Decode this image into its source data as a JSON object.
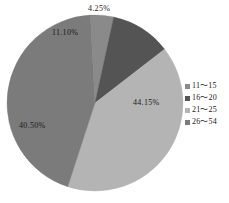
{
  "chart_data": {
    "type": "pie",
    "title": "",
    "subtitle": "",
    "xlabel": "",
    "ylabel": "",
    "grid": false,
    "legend_position": "right",
    "categories": [
      "11〜15",
      "16〜20",
      "21〜25",
      "26〜54"
    ],
    "values": [
      4.25,
      11.1,
      40.5,
      44.15
    ],
    "value_labels": [
      "4.25%",
      "11.10%",
      "40.50%",
      "44.15%"
    ],
    "colors": [
      "#8a8a8a",
      "#545454",
      "#b4b4b4",
      "#7b7b7b"
    ],
    "slices": [
      {
        "label": "4.25%",
        "category": "11〜15",
        "value": 4.25,
        "color": "#8a8a8a"
      },
      {
        "label": "11.10%",
        "category": "16〜20",
        "value": 11.1,
        "color": "#545454"
      },
      {
        "label": "40.50%",
        "category": "21〜25",
        "value": 40.5,
        "color": "#b4b4b4"
      },
      {
        "label": "44.15%",
        "category": "26〜54",
        "value": 44.15,
        "color": "#7b7b7b"
      }
    ],
    "start_angle_deg": -3,
    "total": 100.0
  },
  "legend": {
    "items": [
      {
        "label": "11〜15",
        "color": "#8a8a8a"
      },
      {
        "label": "16〜20",
        "color": "#545454"
      },
      {
        "label": "21〜25",
        "color": "#b4b4b4"
      },
      {
        "label": "26〜54",
        "color": "#7b7b7b"
      }
    ]
  },
  "labels": {
    "slice_0": "4.25%",
    "slice_1": "11.10%",
    "slice_2": "40.50%",
    "slice_3": "44.15%"
  }
}
